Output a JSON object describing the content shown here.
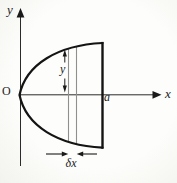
{
  "figure": {
    "type": "math-diagram",
    "background_color": "#fafaf7",
    "ink_color": "#1a1a1a",
    "strip_line_color": "#8f8f8f",
    "axes": {
      "y_label": "y",
      "x_label": "x",
      "origin_label": "O",
      "x_intercept_label": "a"
    },
    "strip": {
      "height_label": "y",
      "width_label": "δx"
    }
  }
}
